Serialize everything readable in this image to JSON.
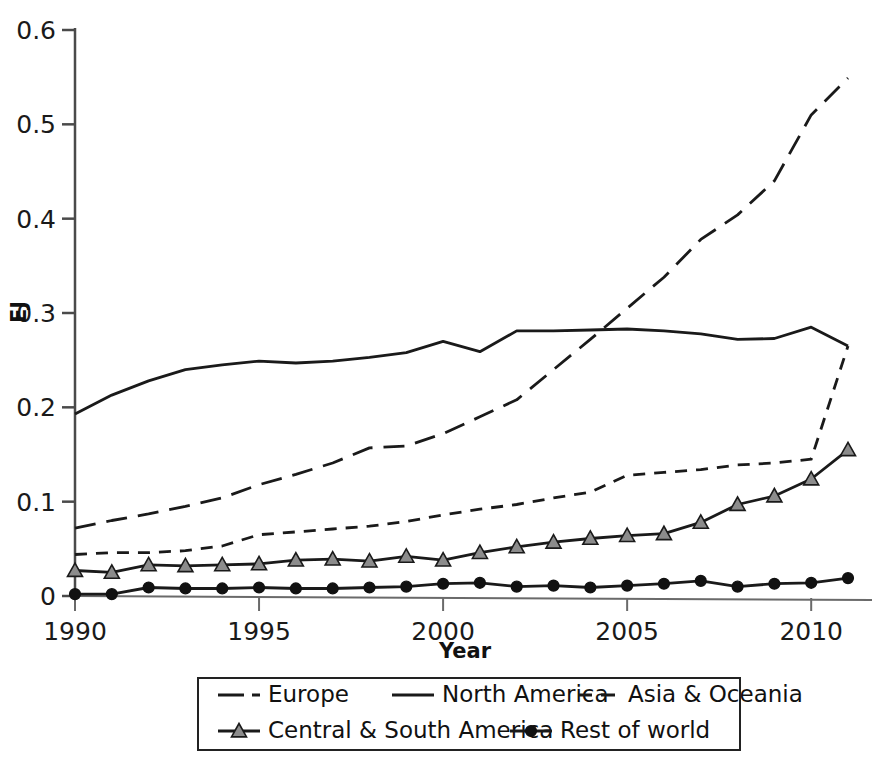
{
  "chart_data": {
    "type": "line",
    "title": "",
    "xlabel": "Year",
    "ylabel": "EJ",
    "xlim": [
      1990,
      2011
    ],
    "ylim": [
      0,
      0.6
    ],
    "grid": false,
    "legend_position": "bottom",
    "x": [
      1990,
      1991,
      1992,
      1993,
      1994,
      1995,
      1996,
      1997,
      1998,
      1999,
      2000,
      2001,
      2002,
      2003,
      2004,
      2005,
      2006,
      2007,
      2008,
      2009,
      2010,
      2011
    ],
    "xticks": [
      1990,
      1995,
      2000,
      2005,
      2010
    ],
    "xtick_labels": [
      "1990",
      "1995",
      "2000",
      "2005",
      "2010"
    ],
    "yticks": [
      0,
      0.1,
      0.2,
      0.3,
      0.4,
      0.5,
      0.6
    ],
    "ytick_labels": [
      "0",
      "0.1",
      "0.2",
      "0.3",
      "0.4",
      "0.5",
      "0.6"
    ],
    "series": [
      {
        "name": "Europe",
        "style": "long-dash",
        "marker": "none",
        "color": "#1a1a1a",
        "values": [
          0.072,
          0.08,
          0.087,
          0.095,
          0.104,
          0.118,
          0.129,
          0.141,
          0.157,
          0.159,
          0.172,
          0.19,
          0.208,
          0.24,
          0.272,
          0.305,
          0.338,
          0.378,
          0.404,
          0.44,
          0.51,
          0.549
        ]
      },
      {
        "name": "North America",
        "style": "solid",
        "marker": "none",
        "color": "#1a1a1a",
        "values": [
          0.193,
          0.213,
          0.228,
          0.24,
          0.245,
          0.249,
          0.247,
          0.249,
          0.253,
          0.258,
          0.27,
          0.259,
          0.281,
          0.281,
          0.282,
          0.283,
          0.281,
          0.278,
          0.272,
          0.273,
          0.285,
          0.265
        ]
      },
      {
        "name": "Asia & Oceania",
        "style": "short-dash",
        "marker": "none",
        "color": "#1a1a1a",
        "values": [
          0.044,
          0.046,
          0.046,
          0.048,
          0.053,
          0.065,
          0.068,
          0.071,
          0.074,
          0.079,
          0.086,
          0.092,
          0.097,
          0.104,
          0.11,
          0.128,
          0.131,
          0.134,
          0.139,
          0.141,
          0.145,
          0.265
        ]
      },
      {
        "name": "Central & South America",
        "style": "solid",
        "marker": "triangle",
        "color": "#1a1a1a",
        "marker_fill": "#8c8c8c",
        "values": [
          0.027,
          0.025,
          0.033,
          0.032,
          0.033,
          0.034,
          0.038,
          0.039,
          0.037,
          0.042,
          0.038,
          0.046,
          0.052,
          0.057,
          0.061,
          0.064,
          0.066,
          0.078,
          0.097,
          0.106,
          0.124,
          0.149
        ]
      },
      {
        "name": "Rest of world",
        "style": "solid",
        "marker": "circle",
        "color": "#1a1a1a",
        "marker_fill": "#111111",
        "values": [
          0.002,
          0.002,
          0.009,
          0.008,
          0.008,
          0.009,
          0.008,
          0.008,
          0.009,
          0.01,
          0.013,
          0.014,
          0.01,
          0.011,
          0.009,
          0.011,
          0.013,
          0.016,
          0.01,
          0.013,
          0.014,
          0.015
        ]
      }
    ],
    "series_last_point_note": {
      "Central & South America": 0.155,
      "Rest of world": 0.019
    }
  }
}
